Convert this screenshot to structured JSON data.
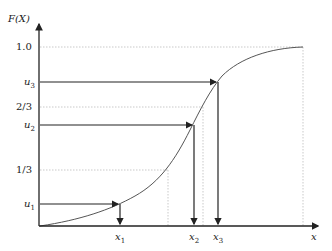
{
  "diagram": {
    "y_axis_label": "F(X)",
    "x_axis_label": "x",
    "y_ticks": [
      {
        "label": "1.0",
        "value": 1.0
      },
      {
        "label": "2/3",
        "value": 0.6667
      },
      {
        "label": "1/3",
        "value": 0.3333
      }
    ],
    "u_labels": {
      "u1": "u",
      "u1_sub": "1",
      "u2": "u",
      "u2_sub": "2",
      "u3": "u",
      "u3_sub": "3"
    },
    "x_labels": {
      "x1": "x",
      "x1_sub": "1",
      "x2": "x",
      "x2_sub": "2",
      "x3": "x",
      "x3_sub": "3"
    },
    "colors": {
      "axis": "#222222",
      "curve": "#555555",
      "guide": "#bbbbbb",
      "arrow": "#222222"
    }
  }
}
